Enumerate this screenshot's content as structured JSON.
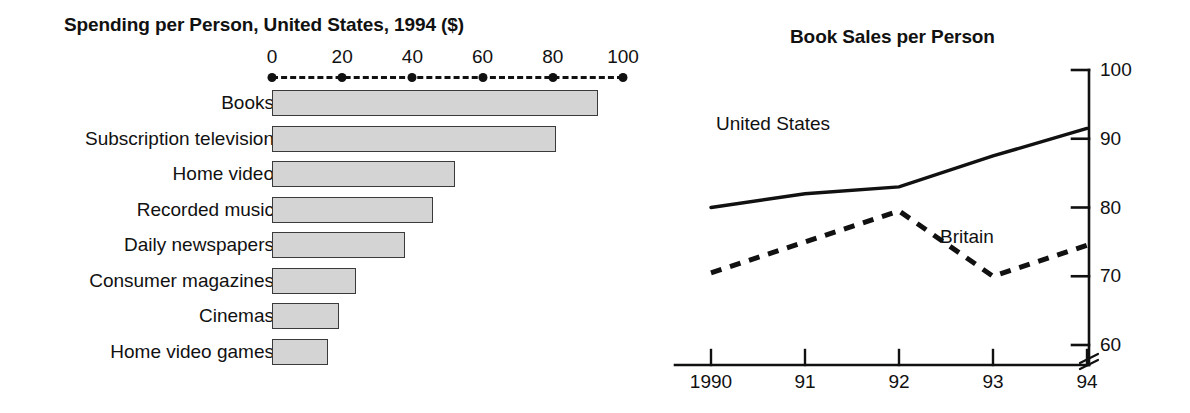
{
  "figure": {
    "background": "#ffffff",
    "ink_color": "#111111",
    "bar_fill_color": "#d4d4d4",
    "bar_stroke_color": "#3a3a3a"
  },
  "chart_data": [
    {
      "type": "bar",
      "orientation": "horizontal",
      "title": "Spending per Person, United States, 1994 ($)",
      "xlabel": "",
      "ylabel": "",
      "xlim": [
        0,
        100
      ],
      "xticks": [
        0,
        20,
        40,
        60,
        80,
        100
      ],
      "xtick_labels": [
        "0",
        "20",
        "40",
        "60",
        "80",
        "100"
      ],
      "grid": false,
      "axis_position": "top",
      "axis_style": "dashed-with-dots",
      "legend": "none",
      "categories": [
        "Books",
        "Subscription television",
        "Home video",
        "Recorded music",
        "Daily newspapers",
        "Consumer magazines",
        "Cinemas",
        "Home video games"
      ],
      "values": [
        93,
        81,
        52,
        46,
        38,
        24,
        19,
        16
      ]
    },
    {
      "type": "line",
      "title": "Book Sales per Person",
      "xlabel": "",
      "ylabel": "",
      "x": [
        1990,
        1991,
        1992,
        1993,
        1994
      ],
      "xtick_labels": [
        "1990",
        "91",
        "92",
        "93",
        "94"
      ],
      "ylim": [
        60,
        100
      ],
      "yticks": [
        60,
        70,
        80,
        90,
        100
      ],
      "ytick_labels": [
        "60",
        "70",
        "80",
        "90",
        "100"
      ],
      "y_axis_position": "right",
      "axis_break": true,
      "grid": false,
      "legend": "inline-annotations",
      "series": [
        {
          "name": "United States",
          "style": "solid",
          "values": [
            80,
            82,
            83,
            87.5,
            91.5
          ]
        },
        {
          "name": "Britain",
          "style": "dashed",
          "values": [
            70.5,
            75,
            79.5,
            70,
            74.5
          ]
        }
      ]
    }
  ]
}
